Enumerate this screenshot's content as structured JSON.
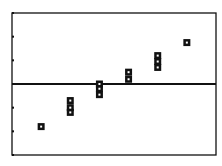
{
  "screen": {
    "type": "graphing-calculator-scatter-plot",
    "frame": {
      "left": 12,
      "top": 13,
      "right": 216,
      "bottom": 155
    },
    "colors": {
      "ink": "#111111",
      "background": "#ffffff"
    }
  },
  "chart_data": {
    "type": "scatter",
    "title": "",
    "xlabel": "",
    "ylabel": "",
    "grid": false,
    "legend": null,
    "marker": "square",
    "x_axis_line_at_y": 0,
    "ylim": [
      -3,
      3
    ],
    "xlim": [
      0,
      7
    ],
    "y_ticks": [
      -3,
      -2,
      -1,
      0,
      1,
      2,
      3
    ],
    "points": [
      {
        "x": 1,
        "y": -1.8
      },
      {
        "x": 2,
        "y": -0.7
      },
      {
        "x": 2,
        "y": -1.0
      },
      {
        "x": 2,
        "y": -1.2
      },
      {
        "x": 3,
        "y": 0.0
      },
      {
        "x": 3,
        "y": -0.2
      },
      {
        "x": 3,
        "y": -0.45
      },
      {
        "x": 4,
        "y": 0.5
      },
      {
        "x": 4,
        "y": 0.2
      },
      {
        "x": 5,
        "y": 1.2
      },
      {
        "x": 5,
        "y": 0.95
      },
      {
        "x": 5,
        "y": 0.7
      },
      {
        "x": 6,
        "y": 1.75
      }
    ]
  }
}
